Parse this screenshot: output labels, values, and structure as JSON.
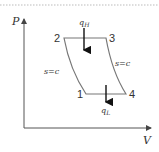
{
  "diagram": {
    "type": "P-V cycle diagram",
    "axes": {
      "y_label": "P",
      "x_label": "V"
    },
    "states": [
      {
        "id": "1",
        "label": "1"
      },
      {
        "id": "2",
        "label": "2"
      },
      {
        "id": "3",
        "label": "3"
      },
      {
        "id": "4",
        "label": "4"
      }
    ],
    "processes": [
      {
        "from": "1",
        "to": "2",
        "label": "s=c"
      },
      {
        "from": "2",
        "to": "3",
        "label": ""
      },
      {
        "from": "3",
        "to": "4",
        "label": "s=c"
      },
      {
        "from": "4",
        "to": "1",
        "label": ""
      }
    ],
    "heat": {
      "in": {
        "label": "q",
        "subscript": "H"
      },
      "out": {
        "label": "q",
        "subscript": "L"
      }
    },
    "colors": {
      "line": "#555555",
      "cycle": "#777777",
      "arrow": "#111111",
      "dashed": "#bbbbbb"
    }
  }
}
